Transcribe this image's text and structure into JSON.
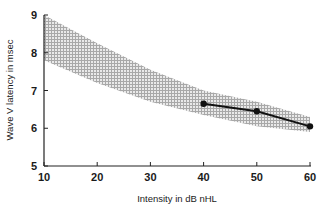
{
  "chart_data": {
    "type": "line",
    "title": "",
    "xlabel": "Intensity in dB nHL",
    "ylabel": "Wave V latency in msec",
    "xlim": [
      10,
      60
    ],
    "ylim": [
      5,
      9
    ],
    "xticks": [
      10,
      20,
      30,
      40,
      50,
      60
    ],
    "yticks": [
      5,
      6,
      7,
      8,
      9
    ],
    "grid": false,
    "legend": null,
    "series": [
      {
        "name": "Measured latency",
        "type": "line",
        "marker": "circle",
        "color": "#111111",
        "x": [
          40,
          50,
          60
        ],
        "y": [
          6.65,
          6.45,
          6.05
        ]
      }
    ],
    "band": {
      "name": "Normal range",
      "type": "area",
      "fill": "crosshatch",
      "color": "#9a9a9a",
      "x": [
        10,
        20,
        30,
        40,
        50,
        60
      ],
      "upper": [
        9.0,
        8.25,
        7.55,
        7.0,
        6.7,
        6.3
      ],
      "lower": [
        7.8,
        7.2,
        6.7,
        6.35,
        6.05,
        5.9
      ]
    }
  },
  "axes": {
    "x_label": "Intensity in dB nHL",
    "y_label": "Wave V latency in msec"
  }
}
